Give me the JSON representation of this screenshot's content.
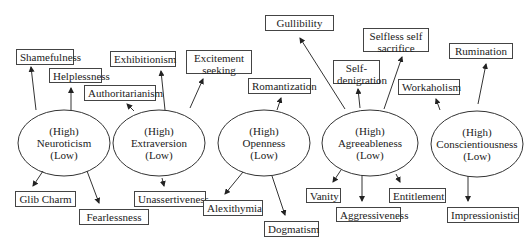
{
  "diagram": {
    "traits": [
      {
        "id": "neuroticism",
        "high": "(High)",
        "name": "Neuroticism",
        "low": "(Low)"
      },
      {
        "id": "extraversion",
        "high": "(High)",
        "name": "Extraversion",
        "low": "(Low)"
      },
      {
        "id": "openness",
        "high": "(High)",
        "name": "Openness",
        "low": "(Low)"
      },
      {
        "id": "agreeableness",
        "high": "(High)",
        "name": "Agreeableness",
        "low": "(Low)"
      },
      {
        "id": "conscientiousness",
        "high": "(High)",
        "name": "Conscientiousness",
        "low": "(Low)"
      }
    ],
    "outcomes": [
      {
        "id": "shamefulness",
        "trait": "neuroticism",
        "pole": "high",
        "label": "Shamefulness"
      },
      {
        "id": "helplessness",
        "trait": "neuroticism",
        "pole": "high",
        "label": "Helplessness"
      },
      {
        "id": "glib-charm",
        "trait": "neuroticism",
        "pole": "low",
        "label": "Glib Charm"
      },
      {
        "id": "fearlessness",
        "trait": "neuroticism",
        "pole": "low",
        "label": "Fearlessness"
      },
      {
        "id": "exhibitionism",
        "trait": "extraversion",
        "pole": "high",
        "label": "Exhibitionism"
      },
      {
        "id": "authoritarianism",
        "trait": "extraversion",
        "pole": "high",
        "label": "Authoritarianism"
      },
      {
        "id": "excitement-seeking",
        "trait": "extraversion",
        "pole": "high",
        "label": "Excitement seeking"
      },
      {
        "id": "unassertiveness",
        "trait": "extraversion",
        "pole": "low",
        "label": "Unassertiveness"
      },
      {
        "id": "romantization",
        "trait": "openness",
        "pole": "high",
        "label": "Romantization"
      },
      {
        "id": "alexithymia",
        "trait": "openness",
        "pole": "low",
        "label": "Alexithymia"
      },
      {
        "id": "dogmatism",
        "trait": "openness",
        "pole": "low",
        "label": "Dogmatism"
      },
      {
        "id": "gullibility",
        "trait": "agreeableness",
        "pole": "high",
        "label": "Gullibility"
      },
      {
        "id": "self-denigration",
        "trait": "agreeableness",
        "pole": "high",
        "label": "Self-denigration"
      },
      {
        "id": "selfless-self-sacrifice",
        "trait": "agreeableness",
        "pole": "high",
        "label": "Selfless self sacrifice"
      },
      {
        "id": "vanity",
        "trait": "agreeableness",
        "pole": "low",
        "label": "Vanity"
      },
      {
        "id": "aggressiveness",
        "trait": "agreeableness",
        "pole": "low",
        "label": "Aggressiveness"
      },
      {
        "id": "entitlement",
        "trait": "agreeableness",
        "pole": "low",
        "label": "Entitlement"
      },
      {
        "id": "workaholism",
        "trait": "conscientiousness",
        "pole": "high",
        "label": "Workaholism"
      },
      {
        "id": "rumination",
        "trait": "conscientiousness",
        "pole": "high",
        "label": "Rumination"
      },
      {
        "id": "impressionistic",
        "trait": "conscientiousness",
        "pole": "low",
        "label": "Impressionistic"
      }
    ],
    "colors": {
      "line": "#333333",
      "box_border": "#444444",
      "background": "#ffffff"
    }
  }
}
